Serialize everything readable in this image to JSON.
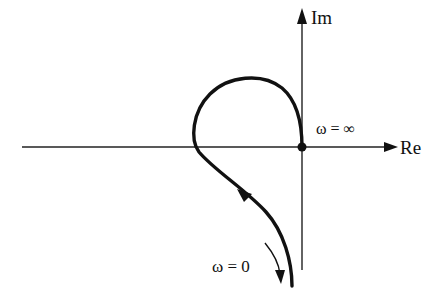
{
  "diagram": {
    "type": "nyquist-plot",
    "axes": {
      "imaginary_label": "Im",
      "real_label": "Re"
    },
    "annotations": {
      "omega_infinity": "ω = ∞",
      "omega_zero": "ω = 0"
    },
    "colors": {
      "ink": "#111111",
      "background": "#ffffff"
    }
  }
}
